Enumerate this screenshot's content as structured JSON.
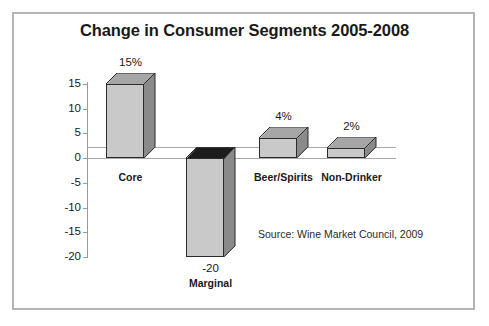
{
  "chart_data": {
    "type": "bar",
    "title": "Change in Consumer Segments 2005-2008",
    "xlabel": "",
    "ylabel": "Percentage Change",
    "categories": [
      "Core",
      "Marginal",
      "Beer/Spirits",
      "Non-Drinker"
    ],
    "values": [
      15,
      -20,
      4,
      2
    ],
    "value_labels": [
      "15%",
      "-20",
      "4%",
      "2%"
    ],
    "ylim": [
      -20,
      15
    ],
    "yticks": [
      15,
      10,
      5,
      0,
      -5,
      -10,
      -15,
      -20
    ],
    "ytick_labels": [
      "15",
      "10",
      "5",
      "0",
      "-5",
      "-10",
      "-15",
      "-20"
    ],
    "grid": false,
    "legend": "none",
    "annotations": [
      "Source: Wine Market Council, 2009"
    ],
    "style": "3d-bar",
    "colors": {
      "bar_front": "#c9c9c9",
      "bar_side": "#8a8a8a",
      "bar_top": "#a6a6a6",
      "bar_top_negative": "#1c1c1c",
      "outline": "#2b2b2b",
      "axis": "#9a9a9a",
      "frame": "#b4b4b4",
      "text": "#1a1a1a",
      "background": "#ffffff"
    }
  },
  "source_note": "Source: Wine Market Council, 2009"
}
